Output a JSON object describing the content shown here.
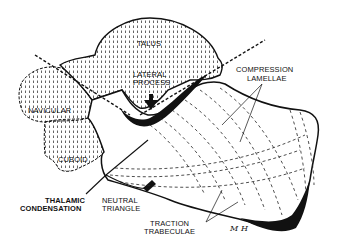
{
  "diagram": {
    "labels": {
      "talus": "TALUS",
      "lateral_process_line1": "LATERAL",
      "lateral_process_line2": "PROCESS",
      "compression_line1": "COMPRESSION",
      "compression_line2": "LAMELLAE",
      "navicular": "NAVICULAR",
      "cuboid": "CUBOID",
      "thalamic_line1": "THALAMIC",
      "thalamic_line2": "CONDENSATION",
      "neutral_line1": "NEUTRAL",
      "neutral_line2": "TRIANGLE",
      "traction_line1": "TRACTION",
      "traction_line2": "TRABECULAE",
      "signature": "M H"
    },
    "colors": {
      "ink": "#111111",
      "background": "#ffffff"
    }
  }
}
